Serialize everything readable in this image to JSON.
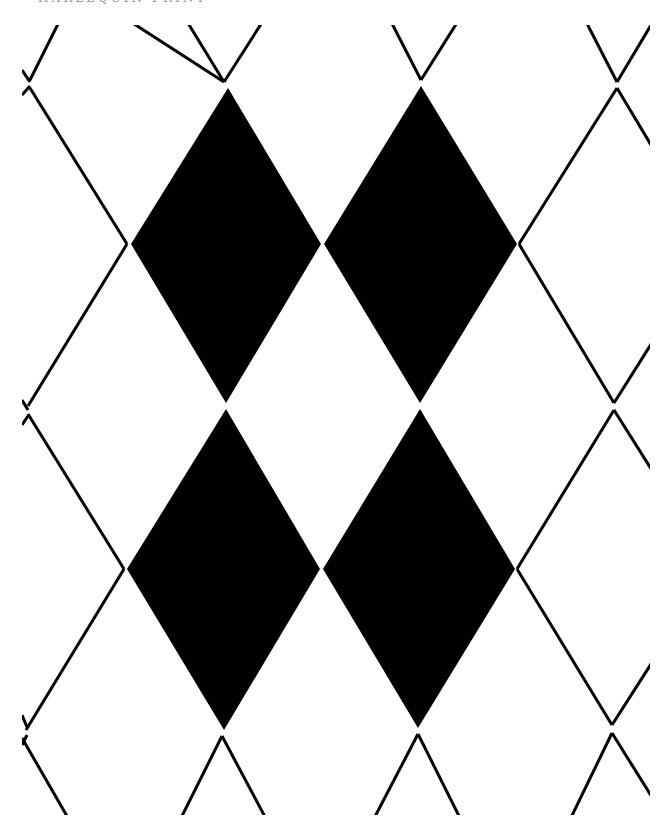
{
  "caption": "HARLEQUIN PRINT",
  "colors": {
    "background": "#ffffff",
    "diamond_fill": "#000000",
    "outline": "#000000"
  },
  "pattern": {
    "type": "argyle-diamond",
    "filled_diamond_count": 4,
    "rows_of_filled_diamonds": 2,
    "columns_of_filled_diamonds": 2
  }
}
